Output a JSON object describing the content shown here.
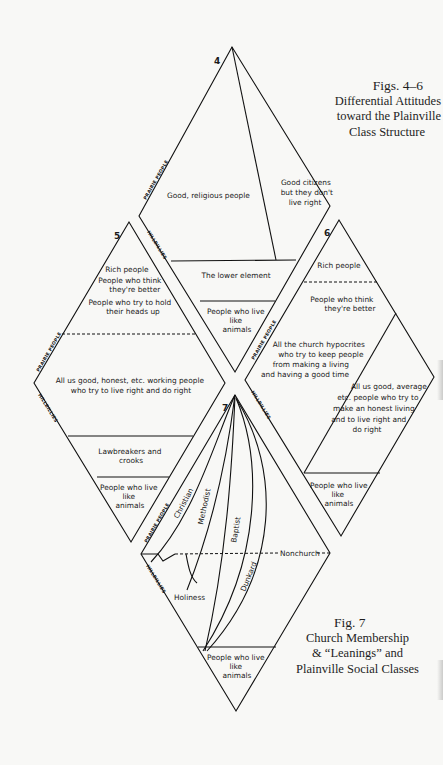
{
  "captions": {
    "figs_4_6": {
      "number": "Figs. 4–6",
      "title_lines": [
        "Differential Attitudes",
        "toward the Plainville",
        "Class Structure"
      ]
    },
    "fig_7": {
      "number": "Fig. 7",
      "title_lines": [
        "Church Membership",
        "& “Leanings” and",
        "Plainville Social Classes"
      ]
    }
  },
  "axis_labels": {
    "prairie": "PRAIRIE PEOPLE",
    "hillbillies": "HILLBILLIES"
  },
  "diagrams": {
    "d4": {
      "number": "4",
      "regions": {
        "good_religious": "Good, religious people",
        "good_citizens": [
          "Good citizens",
          "but they don't",
          "live right"
        ],
        "lower_element": "The lower element",
        "animals": [
          "People who live",
          "like",
          "animals"
        ]
      }
    },
    "d5": {
      "number": "5",
      "regions": {
        "top": [
          "Rich people",
          "People who think",
          "they're better",
          "People who try to hold",
          "their heads up"
        ],
        "middle": [
          "All us good, honest, etc. working people",
          "who try to live right and do right"
        ],
        "lawbreakers": [
          "Lawbreakers and",
          "crooks"
        ],
        "animals": [
          "People who live",
          "like",
          "animals"
        ]
      }
    },
    "d6": {
      "number": "6",
      "regions": {
        "rich": "Rich people",
        "think_better": [
          "People who think",
          "they're better"
        ],
        "hypocrites": [
          "All the church hypocrites",
          "who try to keep people",
          "from making a living",
          "and having a good time"
        ],
        "good_average": [
          "All us good, average",
          "etc. people who try to",
          "make an honest living",
          "and to live right and",
          "do right"
        ],
        "animals": [
          "People who live",
          "like",
          "animals"
        ]
      }
    },
    "d7": {
      "number": "7",
      "regions": {
        "christian": "Christian",
        "methodist": "Methodist",
        "baptist": "Baptist",
        "dunkard": "Dunkard",
        "holiness": "Holiness",
        "nonchurch": "Nonchurch",
        "animals": [
          "People who live",
          "like",
          "animals"
        ]
      }
    }
  },
  "colors": {
    "paper": "#f8f8f6",
    "ink": "#111111"
  }
}
